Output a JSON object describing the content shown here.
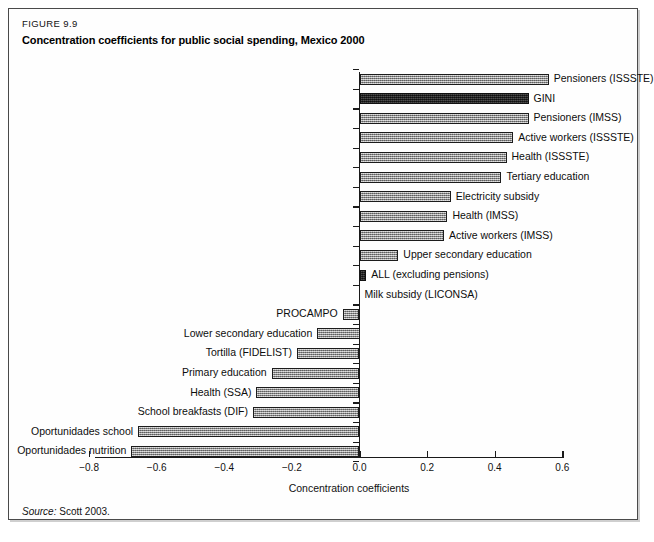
{
  "figure": {
    "number": "FIGURE 9.9",
    "title": "Concentration coefficients for public social spending, Mexico 2000",
    "source_label": "Source:",
    "source_text": "Scott 2003."
  },
  "chart_data": {
    "type": "bar",
    "orientation": "horizontal",
    "title": "Concentration coefficients for public social spending, Mexico 2000",
    "xlabel": "Concentration coefficients",
    "ylabel": "",
    "xlim": [
      -0.8,
      0.6
    ],
    "xticks": [
      -0.8,
      -0.6,
      -0.4,
      -0.2,
      0.0,
      0.2,
      0.4,
      0.6
    ],
    "xticklabels": [
      "−0.8",
      "−0.6",
      "−0.4",
      "−0.2",
      "0.0",
      "0.2",
      "0.4",
      "0.6"
    ],
    "grid": false,
    "legend": "none",
    "categories": [
      "Pensioners (ISSSTE)",
      "GINI",
      "Pensioners (IMSS)",
      "Active workers (ISSSTE)",
      "Health (ISSSTE)",
      "Tertiary education",
      "Electricity subsidy",
      "Health (IMSS)",
      "Active workers (IMSS)",
      "Upper secondary education",
      "ALL (excluding pensions)",
      "Milk subsidy (LICONSA)",
      "PROCAMPO",
      "Lower secondary education",
      "Tortilla (FIDELIST)",
      "Primary education",
      "Health (SSA)",
      "School breakfasts (DIF)",
      "Oportunidades school",
      "Oportunidades nutrition"
    ],
    "values": [
      0.56,
      0.5,
      0.5,
      0.455,
      0.435,
      0.42,
      0.27,
      0.26,
      0.25,
      0.115,
      0.02,
      0.0,
      -0.05,
      -0.125,
      -0.185,
      -0.26,
      -0.305,
      -0.315,
      -0.655,
      -0.675
    ],
    "highlighted": [
      "GINI",
      "ALL (excluding pensions)"
    ],
    "colors": {
      "bar_fill": "#9d9d9d",
      "bar_highlight_fill": "#2e2e2e",
      "bar_border": "#1c1c1c",
      "axis": "#1a1a1a",
      "text": "#0d0d0d",
      "frame": "#4a4a4a"
    }
  }
}
